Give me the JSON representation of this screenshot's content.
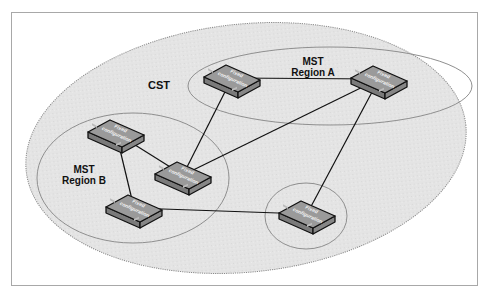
{
  "diagram": {
    "colors": {
      "frame": "#a8a8a8",
      "cst_fill": "#e3e3e3",
      "cst_edge": "#8a8a8a",
      "region_edge": "#8f8f8f",
      "switch_top": "#9a9a9a",
      "switch_side": "#7a7a7a",
      "switch_outline": "#111111",
      "link": "#111111"
    },
    "labels": {
      "cst": "CST",
      "region_a_line1": "MST",
      "region_a_line2": "Region A",
      "region_b_line1": "MST",
      "region_b_line2": "Region B"
    },
    "switch_label_line1": "Fixed",
    "switch_label_line2": "configuration",
    "switches": [
      {
        "id": "a1",
        "region": "Region A"
      },
      {
        "id": "a2",
        "region": "Region A"
      },
      {
        "id": "b1",
        "region": "Region B"
      },
      {
        "id": "b2",
        "region": "Region B"
      },
      {
        "id": "b3",
        "region": "Region B"
      },
      {
        "id": "c1",
        "region": "Single-switch region"
      }
    ],
    "links": [
      [
        "a1",
        "a2"
      ],
      [
        "a1",
        "b2"
      ],
      [
        "a2",
        "b2"
      ],
      [
        "a2",
        "c1"
      ],
      [
        "b1",
        "b2"
      ],
      [
        "b1",
        "b3"
      ],
      [
        "b3",
        "c1"
      ]
    ]
  }
}
